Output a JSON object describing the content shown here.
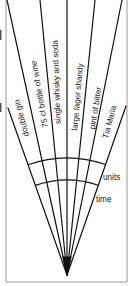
{
  "diagram": {
    "type": "fan-chart",
    "labels": [
      {
        "text": "double gin",
        "x": 22,
        "y": 118,
        "rotate": -105
      },
      {
        "text": "75 cl bottle of wine",
        "x": 40,
        "y": 94,
        "rotate": -100
      },
      {
        "text": "single whisky and soda",
        "x": 57,
        "y": 82,
        "rotate": -92
      },
      {
        "text": "large lager shandy",
        "x": 78,
        "y": 97,
        "rotate": -85
      },
      {
        "text": "pint of bitter",
        "x": 96,
        "y": 108,
        "rotate": -81
      },
      {
        "text": "Tia Maria",
        "x": 110,
        "y": 122,
        "rotate": -75
      }
    ],
    "scale_labels": {
      "units": "units",
      "time": "time"
    },
    "apex": [
      67,
      275
    ],
    "rays": [
      [
        8,
        108
      ],
      [
        7,
        0
      ],
      [
        40,
        0
      ],
      [
        67,
        0
      ],
      [
        95,
        0
      ],
      [
        122,
        0
      ],
      [
        126,
        106
      ]
    ],
    "arcs": [
      {
        "name": "units",
        "radius": 117
      },
      {
        "name": "time",
        "radius": 95
      }
    ],
    "line_color": "#111111",
    "border_color": "#9a9a9a"
  }
}
